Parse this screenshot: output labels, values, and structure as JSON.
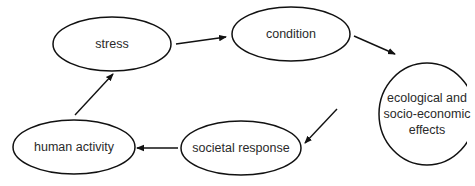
{
  "diagram": {
    "type": "cycle",
    "nodes": [
      {
        "id": "stress",
        "label": "stress",
        "cx": 112,
        "cy": 44,
        "rx": 59,
        "ry": 27
      },
      {
        "id": "condition",
        "label": "condition",
        "cx": 291,
        "cy": 34,
        "rx": 59,
        "ry": 27
      },
      {
        "id": "effects",
        "label": "ecological and\nsocio-economic\neffects",
        "cx": 427,
        "cy": 114,
        "rx": 48,
        "ry": 51
      },
      {
        "id": "societal-response",
        "label": "societal response",
        "cx": 241,
        "cy": 148,
        "rx": 60,
        "ry": 27
      },
      {
        "id": "human-activity",
        "label": "human activity",
        "cx": 74,
        "cy": 147,
        "rx": 61,
        "ry": 27
      }
    ],
    "edges": [
      {
        "from": "stress",
        "to": "condition"
      },
      {
        "from": "condition",
        "to": "effects"
      },
      {
        "from": "effects",
        "to": "societal-response"
      },
      {
        "from": "societal-response",
        "to": "human-activity"
      },
      {
        "from": "human-activity",
        "to": "stress"
      }
    ],
    "colors": {
      "stroke": "#111111",
      "text": "#2a2a2a",
      "background": "#ffffff"
    }
  }
}
